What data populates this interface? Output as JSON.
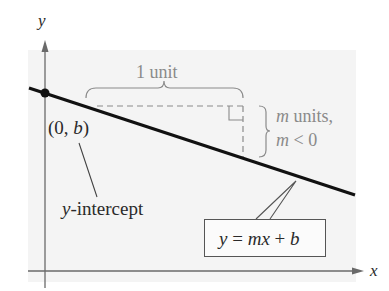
{
  "figure": {
    "axes": {
      "x_label": "x",
      "y_label": "y"
    },
    "line": {
      "equation_y": "y",
      "equation_eq": " = ",
      "equation_m": "m",
      "equation_x": "x",
      "equation_plus": " + ",
      "equation_b": "b",
      "slope_sign": "negative"
    },
    "intercept_point": {
      "open": "(0, ",
      "var": "b",
      "close": ")"
    },
    "intercept_label": {
      "var": "y",
      "text": "-intercept"
    },
    "run_label": "1 unit",
    "rise_label": {
      "line1_var": "m",
      "line1_text": " units,",
      "line2_var": "m",
      "line2_text": " < 0"
    },
    "colors": {
      "background_panel": "#f4f4f4",
      "line": "#111111",
      "annotation": "#8a8a8a",
      "axis": "#666666"
    }
  }
}
